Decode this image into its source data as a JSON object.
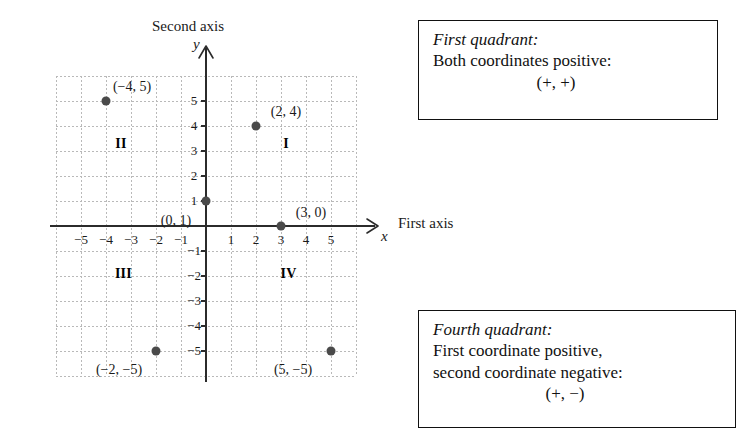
{
  "figure": {
    "axis_titles": {
      "vertical": "Second axis",
      "horizontal": "First axis"
    },
    "axis_variables": {
      "vertical": "y",
      "horizontal": "x"
    }
  },
  "chart_data": {
    "type": "scatter",
    "title": "",
    "xlabel": "First axis",
    "ylabel": "Second axis",
    "xlim": [
      -6,
      6
    ],
    "ylim": [
      -6,
      6
    ],
    "grid": true,
    "legend": "none",
    "x_ticks": [
      -5,
      -4,
      -3,
      -2,
      -1,
      1,
      2,
      3,
      4,
      5
    ],
    "y_ticks": [
      5,
      4,
      3,
      2,
      1,
      -1,
      -2,
      -3,
      -4,
      -5
    ],
    "x_tick_labels": [
      "−5",
      "−4",
      "−3",
      "−2",
      "−1",
      "1",
      "2",
      "3",
      "4",
      "5"
    ],
    "y_tick_labels": [
      "5",
      "4",
      "3",
      "2",
      "1",
      "−1",
      "−2",
      "−3",
      "−4",
      "−5"
    ],
    "points": [
      {
        "x": -4,
        "y": 5,
        "label": "(−4, 5)",
        "label_dx": 26,
        "label_dy": -14
      },
      {
        "x": 2,
        "y": 4,
        "label": "(2, 4)",
        "label_dx": 30,
        "label_dy": -14
      },
      {
        "x": 0,
        "y": 1,
        "label": "(0, 1)",
        "label_dx": -30,
        "label_dy": 20
      },
      {
        "x": 3,
        "y": 0,
        "label": "(3, 0)",
        "label_dx": 30,
        "label_dy": -13
      },
      {
        "x": -2,
        "y": -5,
        "label": "(−2, −5)",
        "label_dx": -37,
        "label_dy": 19
      },
      {
        "x": 5,
        "y": -5,
        "label": "(5, −5)",
        "label_dx": -38,
        "label_dy": 19
      }
    ],
    "quadrant_labels": [
      {
        "name": "I",
        "x": 3.2,
        "y": 3.3
      },
      {
        "name": "II",
        "x": -3.4,
        "y": 3.3
      },
      {
        "name": "III",
        "x": -3.3,
        "y": -1.9
      },
      {
        "name": "IV",
        "x": 3.3,
        "y": -1.9
      }
    ]
  },
  "callouts": {
    "first_quadrant": {
      "heading": "First quadrant:",
      "line1": "Both coordinates positive:",
      "signs": "(+, +)"
    },
    "fourth_quadrant": {
      "heading": "Fourth quadrant:",
      "line1": "First coordinate positive,",
      "line2": "second coordinate negative:",
      "signs": "(+, −)"
    }
  }
}
